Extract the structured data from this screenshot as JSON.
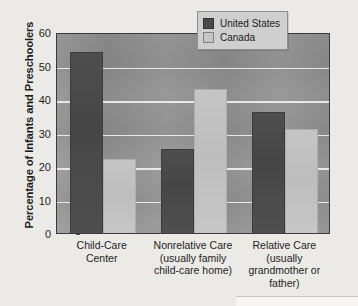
{
  "chart_data": {
    "type": "bar",
    "title": "",
    "xlabel": "",
    "ylabel": "Percentage of Infants and Preschoolers",
    "ylim": [
      0,
      60
    ],
    "yticks": [
      0,
      10,
      20,
      30,
      40,
      50,
      60
    ],
    "ytick_labels": [
      "0",
      "10",
      "20",
      "30",
      "40",
      "50",
      "60"
    ],
    "grid": true,
    "legend_position": "top-right",
    "categories": [
      "Child-Care Center",
      "Nonrelative Care (usually family child-care home)",
      "Relative Care (usually grandmother or father)"
    ],
    "category_label_lines": [
      [
        "Child-Care",
        "Center"
      ],
      [
        "Nonrelative Care",
        "(usually family",
        "child-care home)"
      ],
      [
        "Relative Care",
        "(usually",
        "grandmother or",
        "father)"
      ]
    ],
    "series": [
      {
        "name": "United States",
        "color": "#4a4a4a",
        "values": [
          54,
          25,
          36
        ]
      },
      {
        "name": "Canada",
        "color": "#c6c6c6",
        "values": [
          22,
          43,
          31
        ]
      }
    ]
  },
  "legend": {
    "items": [
      {
        "label": "United States",
        "swatch": "us"
      },
      {
        "label": "Canada",
        "swatch": "ca"
      }
    ]
  },
  "colors": {
    "page_background": "#eceae6",
    "plot_background": "#919191",
    "gridline": "#e8e8e8",
    "frame": "#3a3a3a",
    "united_states": "#4a4a4a",
    "canada": "#c6c6c6",
    "text": "#1d1d1d"
  }
}
